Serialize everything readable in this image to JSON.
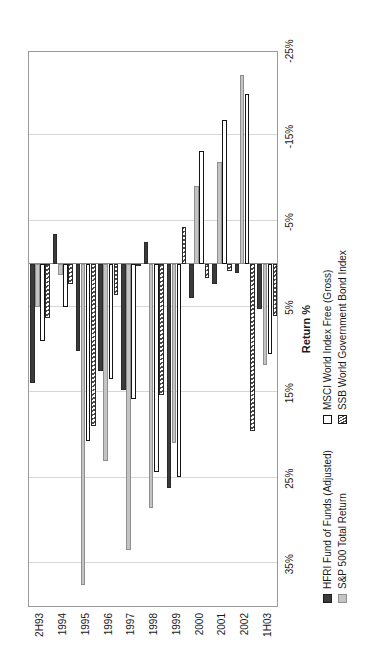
{
  "chart_data": {
    "type": "bar",
    "title": "",
    "subtitle": "",
    "orientation": "horizontal-rotated",
    "xlabel": "",
    "ylabel": "Return %",
    "axis_title": "Return %",
    "categories": [
      "2H93",
      "1994",
      "1995",
      "1996",
      "1997",
      "1998",
      "1999",
      "2000",
      "2001",
      "2002",
      "1H03"
    ],
    "tick_labels": [
      "35%",
      "25%",
      "15%",
      "5%",
      "-5%",
      "-15%",
      "-25%"
    ],
    "tick_values": [
      35,
      25,
      15,
      5,
      -5,
      -15,
      -25
    ],
    "ylim": [
      -25,
      40
    ],
    "axis_min": -25,
    "axis_max": 40,
    "grid": true,
    "legend_position": "bottom-left",
    "series": [
      {
        "name": "HFRI Fund of Funds (Adjusted)",
        "key": "hfri",
        "fill": "solid-dark",
        "color": "#3b3b3b",
        "values": [
          13.9,
          -3.5,
          10.2,
          12.5,
          14.8,
          -2.6,
          26.2,
          4.0,
          2.4,
          1.1,
          5.3
        ]
      },
      {
        "name": "S&P 500 Total Return",
        "key": "spx",
        "fill": "solid-light",
        "color": "#c4c4c4",
        "values": [
          5.0,
          1.3,
          37.6,
          23.0,
          33.4,
          28.6,
          21.0,
          -9.1,
          -11.9,
          -22.1,
          11.8
        ]
      },
      {
        "name": "MSCI World Index Free (Gross)",
        "key": "msci",
        "fill": "open-white",
        "color": "#ffffff",
        "values": [
          9.0,
          5.1,
          20.7,
          13.5,
          15.8,
          24.3,
          24.9,
          -13.2,
          -16.8,
          -19.9,
          10.5
        ]
      },
      {
        "name": "SSB World Government Bond Index",
        "key": "ssb",
        "fill": "diagonal-hatch",
        "color": "#ffffff",
        "values": [
          6.3,
          2.3,
          19.0,
          3.6,
          0.2,
          15.3,
          -4.3,
          1.6,
          0.8,
          19.5,
          6.1
        ]
      }
    ]
  },
  "legend": {
    "columns": [
      {
        "entries": [
          {
            "label": "HFRI Fund of Funds (Adjusted)",
            "key": "hfri"
          },
          {
            "label": "S&P 500 Total Return",
            "key": "spx"
          }
        ]
      },
      {
        "entries": [
          {
            "label": "MSCI World Index Free (Gross)",
            "key": "msci"
          },
          {
            "label": "SSB World Government Bond Index",
            "key": "ssb"
          }
        ]
      }
    ]
  },
  "colors": {
    "hfri": "#3b3b3b",
    "spx": "#c4c4c4",
    "msci": "#ffffff",
    "ssb": "#ffffff",
    "grid": "#d6d6d6",
    "frame": "#9a9a9a",
    "text": "#1a1a1a"
  }
}
